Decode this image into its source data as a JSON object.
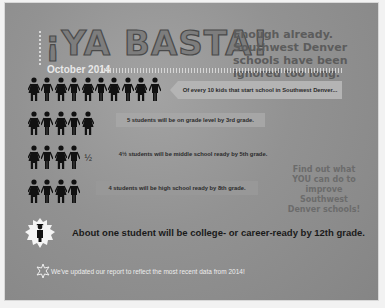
{
  "header": {
    "title": "¡YA BASTA!",
    "tagline": "Enough already. Southwest Denver schools have been ignored too long.",
    "date": "October 2014"
  },
  "rows": [
    {
      "count": 10,
      "half": false,
      "text": "Of every 10 kids that start school in Southwest Denver..."
    },
    {
      "count": 5,
      "half": false,
      "text": "5 students will be on grade level by 3rd grade."
    },
    {
      "count": 4,
      "half": true,
      "half_label": "½",
      "text": "4½ students will be middle school ready by 5th grade."
    },
    {
      "count": 4,
      "half": false,
      "text": "4 students will be high school ready by 8th grade."
    }
  ],
  "cta": "Find out what YOU can do to improve Southwest Denver schools!",
  "college": {
    "text": "About one student will be college- or career-ready by 12th grade.",
    "icon": "graduate-badge-icon"
  },
  "footer": {
    "icon": "starburst-icon",
    "text": "We've updated our report to reflect the most recent data from 2014!"
  },
  "colors": {
    "background": "#8f8f8f",
    "figures": "#111111",
    "callout": "#a6a6a6",
    "highlight_text": "#ededed"
  }
}
